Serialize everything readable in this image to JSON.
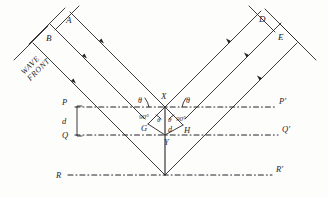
{
  "figure": {
    "type": "optics-ray-diagram",
    "background_color": "#fdfdfb",
    "ink_color": "#25242a",
    "wavefront_text_line1": "WAVE",
    "wavefront_text_line2": "FRONT",
    "labels": {
      "incident_ray_a": "A",
      "incident_ray_b": "B",
      "reflected_ray_d": "D",
      "reflected_ray_e": "E",
      "vertex_x": "X",
      "vertex_y": "Y",
      "foot_g": "G",
      "foot_h": "H",
      "left_p": "P",
      "left_q": "Q",
      "left_r": "R",
      "right_p_prime": "P'",
      "right_q_prime": "Q'",
      "right_r_prime": "R'",
      "spacing_d_left": "d",
      "spacing_d_center": "d",
      "angle_theta_left_upper": "θ",
      "angle_theta_right_upper": "θ",
      "angle_theta_left_lower": "θ",
      "angle_theta_right_lower": "θ",
      "right_angle_left": "90°",
      "right_angle_right": "90°"
    }
  }
}
